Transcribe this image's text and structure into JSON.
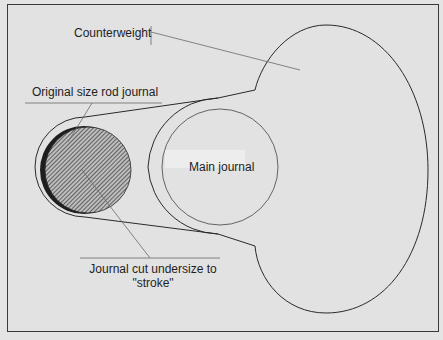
{
  "figure": {
    "type": "crankshaft-throw-diagram",
    "labels": {
      "counterweight": "Counterweight",
      "original_rod_journal": "Original size rod journal",
      "main_journal": "Main journal",
      "undersize_journal_line1": "Journal cut undersize to",
      "undersize_journal_line2": "\"stroke\""
    },
    "colors": {
      "background": "#e2e2e2",
      "outline": "#2a2a2a",
      "leader": "#6a6a6a",
      "hatch": "#3a3a3a",
      "crescent": "#1a1a1a"
    }
  }
}
